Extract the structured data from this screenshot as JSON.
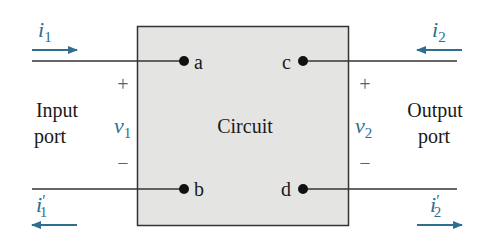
{
  "diagram": {
    "block": {
      "label": "Circuit",
      "fill": "#e4e5e3",
      "stroke": "#333333"
    },
    "terminals": [
      {
        "id": "a",
        "label": "a"
      },
      {
        "id": "b",
        "label": "b"
      },
      {
        "id": "c",
        "label": "c"
      },
      {
        "id": "d",
        "label": "d"
      }
    ],
    "ports": {
      "input": {
        "line1": "Input",
        "line2": "port"
      },
      "output": {
        "line1": "Output",
        "line2": "port"
      }
    },
    "voltages": {
      "v1": {
        "sym": "v",
        "sub": "1",
        "plus": "+",
        "minus": "−"
      },
      "v2": {
        "sym": "v",
        "sub": "2",
        "plus": "+",
        "minus": "−"
      }
    },
    "currents": {
      "i1": {
        "sym": "i",
        "sub": "1",
        "prime": "",
        "direction": "right"
      },
      "i1p": {
        "sym": "i",
        "sub": "1",
        "prime": "′",
        "direction": "left"
      },
      "i2": {
        "sym": "i",
        "sub": "2",
        "prime": "",
        "direction": "left"
      },
      "i2p": {
        "sym": "i",
        "sub": "2",
        "prime": "′",
        "direction": "right"
      }
    },
    "colors": {
      "accent": "#2e6e8e",
      "wire": "#333333",
      "text": "#1a1a1a"
    }
  }
}
